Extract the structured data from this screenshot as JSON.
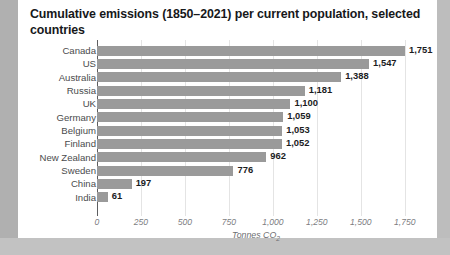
{
  "chart_data": {
    "type": "bar",
    "orientation": "horizontal",
    "title": "Cumulative emissions (1850–2021) per current population, selected countries",
    "xlabel": "Tonnes CO₂",
    "ylabel": "",
    "categories": [
      "Canada",
      "US",
      "Australia",
      "Russia",
      "UK",
      "Germany",
      "Belgium",
      "Finland",
      "New Zealand",
      "Sweden",
      "China",
      "India"
    ],
    "values": [
      1751,
      1547,
      1388,
      1181,
      1100,
      1059,
      1053,
      1052,
      962,
      776,
      197,
      61
    ],
    "value_labels": [
      "1,751",
      "1,547",
      "1,388",
      "1,181",
      "1,100",
      "1,059",
      "1,053",
      "1,052",
      "962",
      "776",
      "197",
      "61"
    ],
    "xlim": [
      0,
      1850
    ],
    "xticks": [
      0,
      250,
      500,
      750,
      1000,
      1250,
      1500,
      1750
    ],
    "xtick_labels": [
      "0",
      "250",
      "500",
      "750",
      "1,000",
      "1,250",
      "1,500",
      "1,750"
    ],
    "grid": true,
    "legend": null,
    "bar_color": "#9a9a9a",
    "axis_color": "#5d5e60",
    "gridline_color": "#e4e4e4",
    "background_color": "#ffffff",
    "frame_color": "#b8b8b8"
  }
}
